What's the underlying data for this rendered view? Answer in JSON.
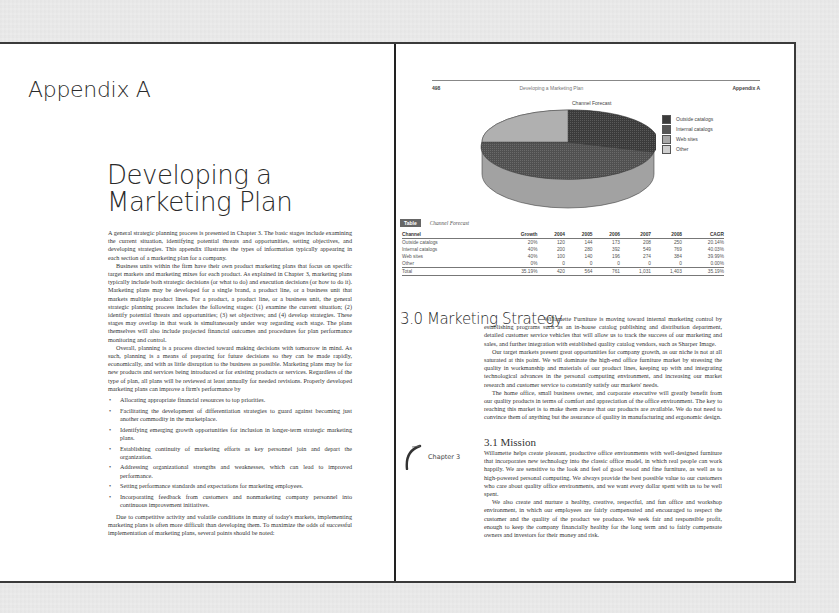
{
  "left_page": {
    "appendix_title": "Appendix A",
    "chapter_title": "Developing a Marketing Plan",
    "paragraphs": [
      "A general strategic planning process is presented in Chapter 3. The basic stages include examining the current situation, identifying potential threats and opportunities, setting objectives, and developing strategies. This appendix illustrates the types of information typically appearing in each section of a marketing plan for a company.",
      "Business units within the firm have their own product marketing plans that focus on specific target markets and marketing mixes for each product. As explained in Chapter 3, marketing plans typically include both strategic decisions (or what to do) and execution decisions (or how to do it). Marketing plans may be developed for a single brand, a product line, or a business unit that markets multiple product lines. For a product, a product line, or a business unit, the general strategic planning process includes the following stages: (1) examine the current situation; (2) identify potential threats and opportunities; (3) set objectives; and (4) develop strategies. These stages may overlap in that work is simultaneously under way regarding each stage. The plans themselves will also include projected financial outcomes and procedures for plan performance monitoring and control.",
      "Overall, planning is a process directed toward making decisions with tomorrow in mind. As such, planning is a means of preparing for future decisions so they can be made rapidly, economically, and with as little disruption to the business as possible. Marketing plans may be for new products and services being introduced or for existing products or services. Regardless of the type of plan, all plans will be reviewed at least annually for needed revisions. Properly developed marketing plans can improve a firm's performance by"
    ],
    "bullets": [
      "Allocating appropriate financial resources to top priorities.",
      "Facilitating the development of differentiation strategies to guard against becoming just another commodity in the marketplace.",
      "Identifying emerging growth opportunities for inclusion in longer-term strategic marketing plans.",
      "Establishing continuity of marketing efforts as key personnel join and depart the organization.",
      "Addressing organizational strengths and weaknesses, which can lead to improved performance.",
      "Setting performance standards and expectations for marketing employees.",
      "Incorporating feedback from customers and nonmarketing company personnel into continuous improvement initiatives."
    ],
    "closing": "Due to competitive activity and volatile conditions in many of today's markets, implementing marketing plans is often more difficult than developing them. To maximize the odds of successful implementation of marketing plans, several points should be noted:"
  },
  "right_page": {
    "running_head": {
      "page_number": "498",
      "center": "Developing a Marketing Plan",
      "right": "Appendix A"
    },
    "chart": {
      "title": "Channel Forecast",
      "legend": [
        {
          "label": "Outside catalogs",
          "color": "#3a3a3a"
        },
        {
          "label": "Internal catalogs",
          "color": "#555555"
        },
        {
          "label": "Web sites",
          "color": "#a8a8a8"
        },
        {
          "label": "Other",
          "color": "#cfcfcf"
        }
      ]
    },
    "table": {
      "badge": "Table",
      "caption": "Channel Forecast",
      "headers": [
        "Channel",
        "Growth",
        "2004",
        "2005",
        "2006",
        "2007",
        "2008",
        "CAGR"
      ],
      "rows": [
        [
          "Outside catalogs",
          "20%",
          "120",
          "144",
          "173",
          "208",
          "250",
          "20.14%"
        ],
        [
          "Internal catalogs",
          "40%",
          "200",
          "280",
          "392",
          "549",
          "769",
          "40.03%"
        ],
        [
          "Web sites",
          "40%",
          "100",
          "140",
          "196",
          "274",
          "384",
          "39.99%"
        ],
        [
          "Other",
          "0%",
          "0",
          "0",
          "0",
          "0",
          "0",
          "0.00%"
        ],
        [
          "Total",
          "35.19%",
          "420",
          "564",
          "761",
          "1,031",
          "1,403",
          "35.19%"
        ]
      ]
    },
    "section_30": {
      "heading": "3.0 Marketing Strategy",
      "paragraphs": [
        "Willamette Furniture is moving toward internal marketing control by establishing programs such as an in-house catalog publishing and distribution department, detailed customer service vehicles that will allow us to track the success of our marketing and sales, and further integration with established quality catalog vendors, such as Sharper Image.",
        "Our target markets present great opportunities for company growth, as our niche is not at all saturated at this point. We will dominate the high-end office furniture market by stressing the quality in workmanship and materials of our product lines, keeping up with and integrating technological advances in the personal computing environment, and increasing our market research and customer service to constantly satisfy our markets' needs.",
        "The home office, small business owner, and corporate executive will greatly benefit from our quality products in terms of comfort and appreciation of the office environment. The key to reaching this market is to make them aware that our products are available. We do not need to convince them of anything but the assurance of quality in manufacturing and ergonomic design."
      ]
    },
    "chapter_tab": "Chapter 3",
    "section_31": {
      "heading": "3.1 Mission",
      "paragraphs": [
        "Willamette helps create pleasant, productive office environments with well-designed furniture that incorporates new technology into the classic office model, in which real people can work happily. We are sensitive to the look and feel of good wood and fine furniture, as well as to high-powered personal computing. We always provide the best possible value to our customers who care about quality office environments, and we want every dollar spent with us to be well spent.",
        "We also create and nurture a healthy, creative, respectful, and fun office and workshop environment, in which our employees are fairly compensated and encouraged to respect the customer and the quality of the product we produce. We seek fair and responsible profit, enough to keep the company financially healthy for the long term and to fairly compensate owners and investors for their money and risk."
      ]
    }
  }
}
